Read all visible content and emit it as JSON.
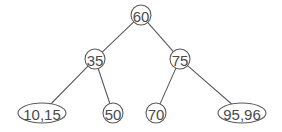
{
  "diagram": {
    "type": "binary-search-tree",
    "colors": {
      "stroke": "#5a5a5a",
      "text": "#4a4a4a",
      "background": "#ffffff"
    },
    "nodes": [
      {
        "id": "n60",
        "label": "60",
        "shape": "circle",
        "cx": 141,
        "cy": 15,
        "rx": 10,
        "ry": 10
      },
      {
        "id": "n35",
        "label": "35",
        "shape": "circle",
        "cx": 95,
        "cy": 59,
        "rx": 10,
        "ry": 10
      },
      {
        "id": "n75",
        "label": "75",
        "shape": "circle",
        "cx": 180,
        "cy": 59,
        "rx": 10,
        "ry": 10
      },
      {
        "id": "n10_15",
        "label": "10,15",
        "shape": "ellipse",
        "cx": 42,
        "cy": 113,
        "rx": 24,
        "ry": 10
      },
      {
        "id": "n50",
        "label": "50",
        "shape": "circle",
        "cx": 113,
        "cy": 113,
        "rx": 10,
        "ry": 10
      },
      {
        "id": "n70",
        "label": "70",
        "shape": "circle",
        "cx": 156,
        "cy": 113,
        "rx": 10,
        "ry": 10
      },
      {
        "id": "n95_96",
        "label": "95,96",
        "shape": "ellipse",
        "cx": 242,
        "cy": 113,
        "rx": 24,
        "ry": 10
      }
    ],
    "edges": [
      {
        "from": "n60",
        "to": "n35"
      },
      {
        "from": "n60",
        "to": "n75"
      },
      {
        "from": "n35",
        "to": "n10_15"
      },
      {
        "from": "n35",
        "to": "n50"
      },
      {
        "from": "n75",
        "to": "n70"
      },
      {
        "from": "n75",
        "to": "n95_96"
      }
    ]
  }
}
